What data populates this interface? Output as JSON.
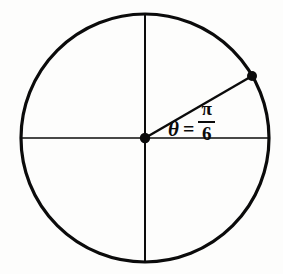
{
  "figure": {
    "background_color": "#fdfdfc",
    "ink_color": "#0b0b0b"
  },
  "geometry": {
    "circle": {
      "center_x": 145,
      "center_y": 138,
      "radius": 124,
      "stroke_width": 3.2,
      "fill": "none"
    },
    "horizontal_diameter": {
      "x1": 21,
      "y1": 138,
      "x2": 269,
      "y2": 138,
      "stroke_width": 1.7
    },
    "vertical_diameter": {
      "x1": 145,
      "y1": 14,
      "x2": 145,
      "y2": 262,
      "stroke_width": 2.0
    },
    "radius_segment": {
      "x1": 145,
      "y1": 138,
      "x2": 252,
      "y2": 76,
      "stroke_width": 2.4,
      "angle_degrees": 30
    },
    "center_point": {
      "cx": 145,
      "cy": 138,
      "r": 5.2
    },
    "terminal_point": {
      "cx": 252,
      "cy": 76,
      "r": 5.0
    }
  },
  "label": {
    "theta": "θ",
    "equals": "=",
    "numerator": "π",
    "denominator": "6",
    "full_text": "θ = π/6"
  },
  "chart_data": {
    "type": "scatter",
    "xlabel": "",
    "ylabel": "",
    "xlim": [
      -1,
      1
    ],
    "ylim": [
      -1,
      1
    ],
    "grid": false,
    "legend": null,
    "annotations": [
      "θ = π/6"
    ],
    "series": [
      {
        "name": "unit circle",
        "shape": "circle",
        "center": [
          0,
          0
        ],
        "radius": 1
      },
      {
        "name": "horizontal axis (diameter)",
        "shape": "line",
        "points": [
          [
            -1,
            0
          ],
          [
            1,
            0
          ]
        ]
      },
      {
        "name": "vertical axis (diameter)",
        "shape": "line",
        "points": [
          [
            0,
            -1
          ],
          [
            0,
            1
          ]
        ]
      },
      {
        "name": "terminal ray at theta = pi/6",
        "shape": "line",
        "points": [
          [
            0,
            0
          ],
          [
            0.866,
            0.5
          ]
        ]
      },
      {
        "name": "marked points",
        "shape": "points",
        "points": [
          [
            0,
            0
          ],
          [
            0.866,
            0.5
          ]
        ]
      }
    ]
  }
}
